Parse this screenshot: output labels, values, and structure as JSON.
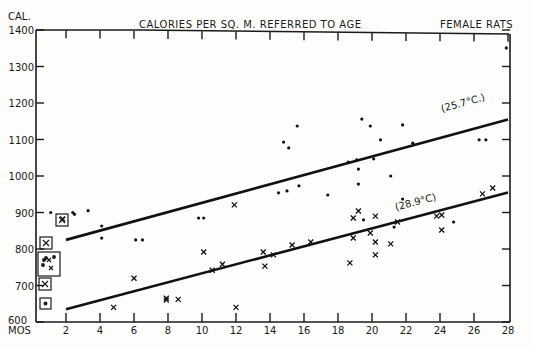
{
  "chart_data": {
    "type": "scatter",
    "title": "CALORIES PER SQ. M. REFERRED TO AGE",
    "subtitle": "FEMALE RATS",
    "xlabel": "MOS",
    "ylabel": "CAL.",
    "xlim": [
      0,
      28
    ],
    "ylim": [
      600,
      1400
    ],
    "x_ticks": [
      "2",
      "4",
      "6",
      "8",
      "10",
      "12",
      "14",
      "16",
      "18",
      "20",
      "22",
      "24",
      "26",
      "28"
    ],
    "y_ticks": [
      "600",
      "700",
      "800",
      "900",
      "1000",
      "1100",
      "1200",
      "1300",
      "1400"
    ],
    "grid": false,
    "series": [
      {
        "name": "25.7°C",
        "marker": "dot",
        "points": [
          [
            1.1,
            900
          ],
          [
            2.4,
            900
          ],
          [
            2.5,
            895
          ],
          [
            3.3,
            905
          ],
          [
            4.1,
            863
          ],
          [
            4.1,
            830
          ],
          [
            6.1,
            825
          ],
          [
            6.5,
            825
          ],
          [
            9.8,
            885
          ],
          [
            10.1,
            885
          ],
          [
            14.5,
            954
          ],
          [
            14.8,
            1093
          ],
          [
            15.0,
            959
          ],
          [
            15.1,
            1077
          ],
          [
            15.6,
            1137
          ],
          [
            15.7,
            973
          ],
          [
            17.4,
            948
          ],
          [
            18.6,
            1038
          ],
          [
            19.1,
            1044
          ],
          [
            19.2,
            1019
          ],
          [
            19.2,
            978
          ],
          [
            19.4,
            1156
          ],
          [
            19.5,
            880
          ],
          [
            19.9,
            1137
          ],
          [
            20.1,
            1047
          ],
          [
            20.5,
            1099
          ],
          [
            21.1,
            1000
          ],
          [
            21.3,
            860
          ],
          [
            21.8,
            1140
          ],
          [
            21.8,
            937
          ],
          [
            22.4,
            1090
          ],
          [
            24.8,
            874
          ],
          [
            26.3,
            1099
          ],
          [
            26.7,
            1099
          ],
          [
            27.9,
            1351
          ]
        ],
        "trend_line": {
          "label": "(25.7°C.)",
          "from": [
            2,
            825
          ],
          "to": [
            28,
            1155
          ]
        }
      },
      {
        "name": "28.9°C",
        "marker": "cross",
        "points": [
          [
            1.8,
            882
          ],
          [
            4.8,
            640
          ],
          [
            6.0,
            720
          ],
          [
            7.9,
            665
          ],
          [
            7.9,
            660
          ],
          [
            8.6,
            662
          ],
          [
            10.1,
            792
          ],
          [
            10.6,
            742
          ],
          [
            11.2,
            758
          ],
          [
            11.9,
            921
          ],
          [
            12.0,
            640
          ],
          [
            13.6,
            792
          ],
          [
            13.7,
            753
          ],
          [
            14.2,
            784
          ],
          [
            15.3,
            811
          ],
          [
            16.4,
            819
          ],
          [
            18.7,
            762
          ],
          [
            18.9,
            885
          ],
          [
            18.9,
            830
          ],
          [
            19.2,
            904
          ],
          [
            19.9,
            844
          ],
          [
            20.2,
            890
          ],
          [
            20.2,
            819
          ],
          [
            20.2,
            784
          ],
          [
            21.1,
            814
          ],
          [
            21.5,
            874
          ],
          [
            23.8,
            890
          ],
          [
            24.1,
            893
          ],
          [
            24.1,
            852
          ],
          [
            26.5,
            951
          ],
          [
            27.1,
            967
          ]
        ],
        "trend_line": {
          "label": "(28.9°C)",
          "from": [
            2,
            635
          ],
          "to": [
            28,
            955
          ]
        }
      }
    ],
    "annotations": [
      {
        "type": "boxed-group",
        "note": "boxed markers near age 0-2 months",
        "values": [
          "~815 (x)",
          "~750 group",
          "~700 (x)",
          "~650 (dot)",
          "~880 (x)"
        ]
      }
    ]
  },
  "chart": {
    "title": "CALORIES PER SQ. M. REFERRED TO AGE",
    "subtitle": "FEMALE RATS",
    "ylabel": "CAL.",
    "xlabel": "MOS",
    "line1_label": "(25.7°C.)",
    "line2_label": "(28.9°C)"
  }
}
